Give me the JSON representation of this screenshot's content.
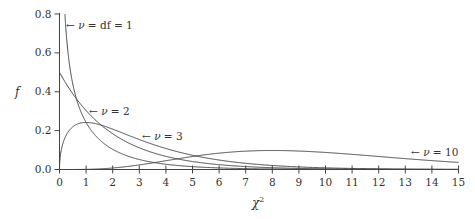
{
  "chart_data": {
    "type": "line",
    "title": "",
    "xlabel": "χ²",
    "ylabel": "f",
    "xlim": [
      0,
      15
    ],
    "ylim": [
      0,
      0.8
    ],
    "grid": false,
    "legend": "none (inline annotations)",
    "x_ticks": [
      "0",
      "1",
      "2",
      "3",
      "4",
      "5",
      "6",
      "7",
      "8",
      "9",
      "10",
      "11",
      "12",
      "13",
      "14",
      "15"
    ],
    "y_ticks": [
      "0.0",
      "0.2",
      "0.4",
      "0.6",
      "0.8"
    ],
    "series": [
      {
        "name": "ν = df = 1",
        "df": 1,
        "annotation": "← ν = df = 1",
        "x": [
          0.1,
          0.2,
          0.3,
          0.5,
          1,
          2,
          3,
          4,
          5,
          6,
          8,
          10,
          15
        ],
        "values": [
          1.2,
          0.807,
          0.627,
          0.439,
          0.242,
          0.104,
          0.051,
          0.027,
          0.015,
          0.008,
          0.003,
          0.001,
          0.0
        ]
      },
      {
        "name": "ν = 2",
        "df": 2,
        "annotation": "← ν = 2",
        "x": [
          0,
          0.5,
          1,
          2,
          3,
          4,
          5,
          6,
          8,
          10,
          15
        ],
        "values": [
          0.5,
          0.389,
          0.303,
          0.184,
          0.112,
          0.068,
          0.041,
          0.025,
          0.009,
          0.003,
          0.0
        ]
      },
      {
        "name": "ν = 3",
        "df": 3,
        "annotation": "← ν = 3",
        "x": [
          0,
          0.5,
          1,
          2,
          3,
          4,
          5,
          6,
          8,
          10,
          15
        ],
        "values": [
          0.0,
          0.219,
          0.242,
          0.208,
          0.154,
          0.108,
          0.073,
          0.048,
          0.02,
          0.008,
          0.0
        ]
      },
      {
        "name": "ν = 10",
        "df": 10,
        "annotation": "← ν = 10",
        "x": [
          0,
          2,
          4,
          6,
          8,
          10,
          12,
          14,
          15
        ],
        "values": [
          0.0,
          0.008,
          0.045,
          0.085,
          0.098,
          0.088,
          0.067,
          0.046,
          0.037
        ]
      }
    ]
  },
  "labels": {
    "y_axis": "f",
    "x_axis": "χ",
    "x_axis_sup": "2",
    "ann1_pre": "← ",
    "ann1_nu": "ν",
    "ann1_post": " = df = 1",
    "ann2_pre": "← ",
    "ann2_nu": "ν",
    "ann2_post": " = 2",
    "ann3_pre": "← ",
    "ann3_nu": "ν",
    "ann3_post": " = 3",
    "ann10_pre": "← ",
    "ann10_nu": "ν",
    "ann10_post": " = 10"
  }
}
